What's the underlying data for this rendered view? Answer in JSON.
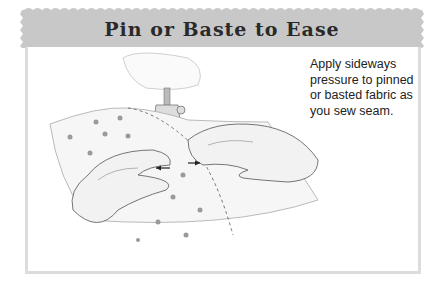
{
  "header": {
    "title": "Pin or Baste to Ease",
    "background_color": "#c8c8c8"
  },
  "caption": {
    "text": "Apply sideways pressure to pinned or basted fabric as you sew seam."
  },
  "illustration": {
    "description": "Pencil sketch of two hands guiding polka-dot fabric under a sewing machine presser foot"
  }
}
